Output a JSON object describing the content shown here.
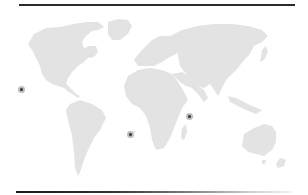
{
  "map": {
    "type": "world-map",
    "land_color": "#e3e3e3",
    "background_color": "#ffffff",
    "rules": {
      "top_color": "#2a2a2a",
      "bottom_gradient": [
        "#1a1a1a",
        "#f2f2f2"
      ]
    },
    "markers": [
      {
        "name": "marker-pacific-mexico",
        "x": 21,
        "y": 89,
        "label": ""
      },
      {
        "name": "marker-south-atlantic",
        "x": 130,
        "y": 134,
        "label": "'"
      },
      {
        "name": "marker-east-africa",
        "x": 189,
        "y": 116,
        "label": ""
      }
    ]
  }
}
